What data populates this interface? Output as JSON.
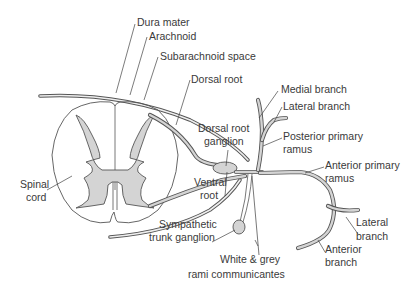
{
  "diagram": {
    "labels": {
      "dura_mater": "Dura mater",
      "arachnoid": "Arachnoid",
      "subarachnoid_space": "Subarachnoid space",
      "dorsal_root": "Dorsal root",
      "dorsal_root_ganglion_1": "Dorsal root",
      "dorsal_root_ganglion_2": "ganglion",
      "medial_branch": "Medial branch",
      "lateral_branch_posterior": "Lateral branch",
      "posterior_primary_ramus_1": "Posterior primary",
      "posterior_primary_ramus_2": "ramus",
      "anterior_primary_ramus_1": "Anterior primary",
      "anterior_primary_ramus_2": "ramus",
      "spinal_cord_1": "Spinal",
      "spinal_cord_2": "cord",
      "ventral_root_1": "Ventral",
      "ventral_root_2": "root",
      "sympathetic_trunk_ganglion_1": "Sympathetic",
      "sympathetic_trunk_ganglion_2": "trunk ganglion",
      "rami_communicantes_1": "White & grey",
      "rami_communicantes_2": "rami communicantes",
      "lateral_branch_anterior_1": "Lateral",
      "lateral_branch_anterior_2": "branch",
      "anterior_branch_1": "Anterior",
      "anterior_branch_2": "branch"
    },
    "colors": {
      "grey_matter": "#d4d4d4",
      "outline": "#555555",
      "text": "#3a3a3a",
      "background": "#ffffff"
    }
  }
}
